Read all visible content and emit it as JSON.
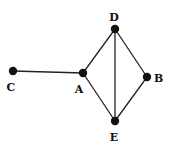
{
  "graph": {
    "nodes": [
      {
        "id": "C",
        "label": "C",
        "x": 13,
        "y": 71,
        "lx": 11,
        "ly": 91,
        "anchor": "middle"
      },
      {
        "id": "A",
        "label": "A",
        "x": 83,
        "y": 73,
        "lx": 79,
        "ly": 93,
        "anchor": "middle"
      },
      {
        "id": "D",
        "label": "D",
        "x": 115,
        "y": 29,
        "lx": 114,
        "ly": 21,
        "anchor": "middle"
      },
      {
        "id": "B",
        "label": "B",
        "x": 147,
        "y": 77,
        "lx": 154,
        "ly": 82,
        "anchor": "start"
      },
      {
        "id": "E",
        "label": "E",
        "x": 115,
        "y": 121,
        "lx": 114,
        "ly": 141,
        "anchor": "middle"
      }
    ],
    "edges": [
      {
        "from": "C",
        "to": "A"
      },
      {
        "from": "A",
        "to": "D"
      },
      {
        "from": "A",
        "to": "E"
      },
      {
        "from": "D",
        "to": "E"
      },
      {
        "from": "D",
        "to": "B"
      },
      {
        "from": "B",
        "to": "E"
      }
    ],
    "colors": {
      "node": "#111111",
      "edge": "#222222",
      "background": "#ffffff"
    }
  }
}
